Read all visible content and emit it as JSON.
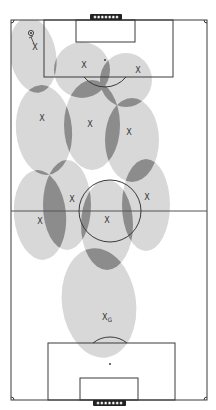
{
  "diagram": {
    "type": "soccer-pitch-zonal-coverage",
    "colors": {
      "background": "#ffffff",
      "zone": "#d8d8d8",
      "overlap": "#8c8c8c",
      "lines": "#3a3a3a"
    },
    "field": {
      "x": 11,
      "y": 20,
      "width": 196,
      "height": 380
    },
    "halfway_y": 211,
    "center_circle": {
      "cx": 110,
      "cy": 211,
      "r": 31
    },
    "top_box": {
      "penalty": {
        "x": 44,
        "y": 20,
        "w": 129,
        "h": 57
      },
      "goal_area": {
        "x": 76,
        "y": 20,
        "w": 59,
        "h": 22
      },
      "spot": {
        "x": 105,
        "y": 60
      },
      "goal": {
        "x": 90,
        "y": 14,
        "w": 32,
        "h": 6
      }
    },
    "bottom_box": {
      "penalty": {
        "x": 48,
        "y": 343,
        "w": 127,
        "h": 57
      },
      "goal_area": {
        "x": 80,
        "y": 378,
        "w": 58,
        "h": 22
      },
      "spot": {
        "x": 110,
        "y": 364
      },
      "goal": {
        "x": 93,
        "y": 400,
        "w": 33,
        "h": 6
      }
    },
    "ball": {
      "x": 31,
      "y": 33,
      "symbol": "⊙"
    },
    "players": [
      {
        "id": 1,
        "label": "X",
        "x": 35,
        "y": 47,
        "zone": {
          "cx": 33,
          "cy": 55,
          "rx": 23,
          "ry": 38,
          "rot": -10
        }
      },
      {
        "id": 2,
        "label": "X",
        "x": 84,
        "y": 65,
        "zone": {
          "cx": 82,
          "cy": 70,
          "rx": 28,
          "ry": 28,
          "rot": 0
        }
      },
      {
        "id": 3,
        "label": "X",
        "x": 138,
        "y": 70,
        "zone": {
          "cx": 126,
          "cy": 80,
          "rx": 26,
          "ry": 27,
          "rot": 0
        }
      },
      {
        "id": 4,
        "label": "X",
        "x": 42,
        "y": 118,
        "zone": {
          "cx": 44,
          "cy": 130,
          "rx": 28,
          "ry": 45,
          "rot": -5
        }
      },
      {
        "id": 5,
        "label": "X",
        "x": 90,
        "y": 124,
        "zone": {
          "cx": 92,
          "cy": 125,
          "rx": 28,
          "ry": 45,
          "rot": 0
        }
      },
      {
        "id": 6,
        "label": "X",
        "x": 129,
        "y": 132,
        "zone": {
          "cx": 132,
          "cy": 140,
          "rx": 27,
          "ry": 42,
          "rot": 0
        }
      },
      {
        "id": 7,
        "label": "X",
        "x": 72,
        "y": 199,
        "zone": {
          "cx": 67,
          "cy": 205,
          "rx": 24,
          "ry": 45,
          "rot": 0
        }
      },
      {
        "id": 8,
        "label": "X",
        "x": 147,
        "y": 197,
        "zone": {
          "cx": 146,
          "cy": 205,
          "rx": 24,
          "ry": 46,
          "rot": 0
        }
      },
      {
        "id": 9,
        "label": "X",
        "x": 40,
        "y": 221,
        "zone": {
          "cx": 40,
          "cy": 215,
          "rx": 26,
          "ry": 45,
          "rot": -5
        }
      },
      {
        "id": 10,
        "label": "X",
        "x": 107,
        "y": 220,
        "zone": {
          "cx": 107,
          "cy": 225,
          "rx": 26,
          "ry": 45,
          "rot": 0
        }
      },
      {
        "id": 11,
        "label": "X",
        "sub": "G",
        "x": 107,
        "y": 317,
        "zone": {
          "cx": 99,
          "cy": 303,
          "rx": 37,
          "ry": 55,
          "rot": -8
        }
      }
    ],
    "ball_arrow": {
      "x1": 31,
      "y1": 37,
      "x2": 34,
      "y2": 44
    }
  }
}
